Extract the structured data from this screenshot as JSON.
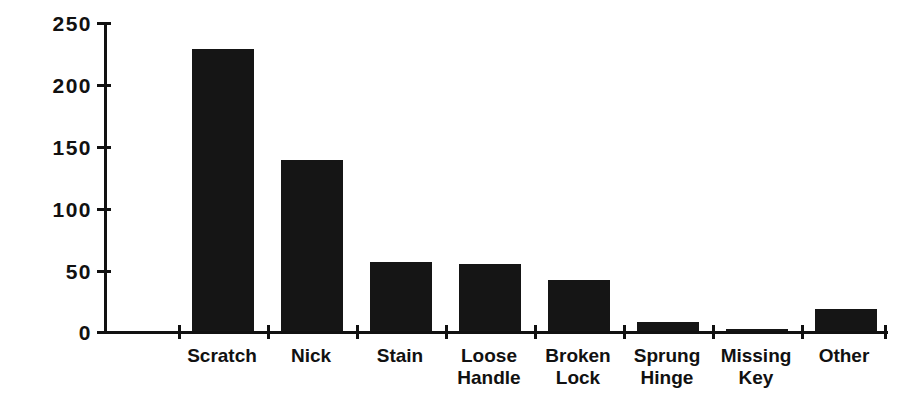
{
  "chart_data": {
    "type": "bar",
    "title": "",
    "subtitle": "",
    "xlabel": "",
    "ylabel": "",
    "categories": [
      "Scratch",
      "Nick",
      "Stain",
      "Loose\nHandle",
      "Broken\nLock",
      "Sprung\nHinge",
      "Missing\nKey",
      "Other"
    ],
    "values": [
      228,
      138,
      56,
      54,
      41,
      7,
      2,
      18
    ],
    "ylim": [
      0,
      250
    ],
    "yticks": [
      0,
      50,
      100,
      150,
      200,
      250
    ],
    "ytick_labels": [
      "0",
      "50",
      "100",
      "150",
      "200",
      "250"
    ],
    "grid": false,
    "legend": false,
    "legend_position": "none",
    "bar_color": "#151515",
    "axis_color": "#111111",
    "background_color": "#ffffff"
  }
}
